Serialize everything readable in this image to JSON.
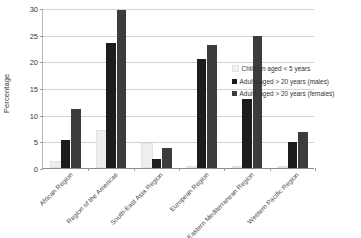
{
  "chart_data": {
    "type": "bar",
    "title": "",
    "xlabel": "",
    "ylabel": "Percentage",
    "ylim": [
      0,
      30
    ],
    "ytick_step": 5,
    "yticks": [
      0,
      5,
      10,
      15,
      20,
      25,
      30
    ],
    "grid": true,
    "legend_position": "right",
    "categories": [
      "African Region",
      "Region of the Americas",
      "South-East Asia Region",
      "European Region",
      "Eastern Mediterranean Region",
      "Western Pacific Region"
    ],
    "series": [
      {
        "name": "Children aged < 5 years",
        "color": "#eeeeee",
        "values": [
          1.0,
          6.7,
          4.3,
          0.0,
          0.0,
          0.0
        ]
      },
      {
        "name": "Adults aged > 20 years (males)",
        "color": "#1c1c1c",
        "values": [
          5.2,
          23.4,
          1.7,
          20.4,
          12.9,
          4.9
        ]
      },
      {
        "name": "Adults aged > 20 years (females)",
        "color": "#3c3c3c",
        "values": [
          11.0,
          29.7,
          3.7,
          23.0,
          24.7,
          6.7
        ]
      }
    ]
  }
}
